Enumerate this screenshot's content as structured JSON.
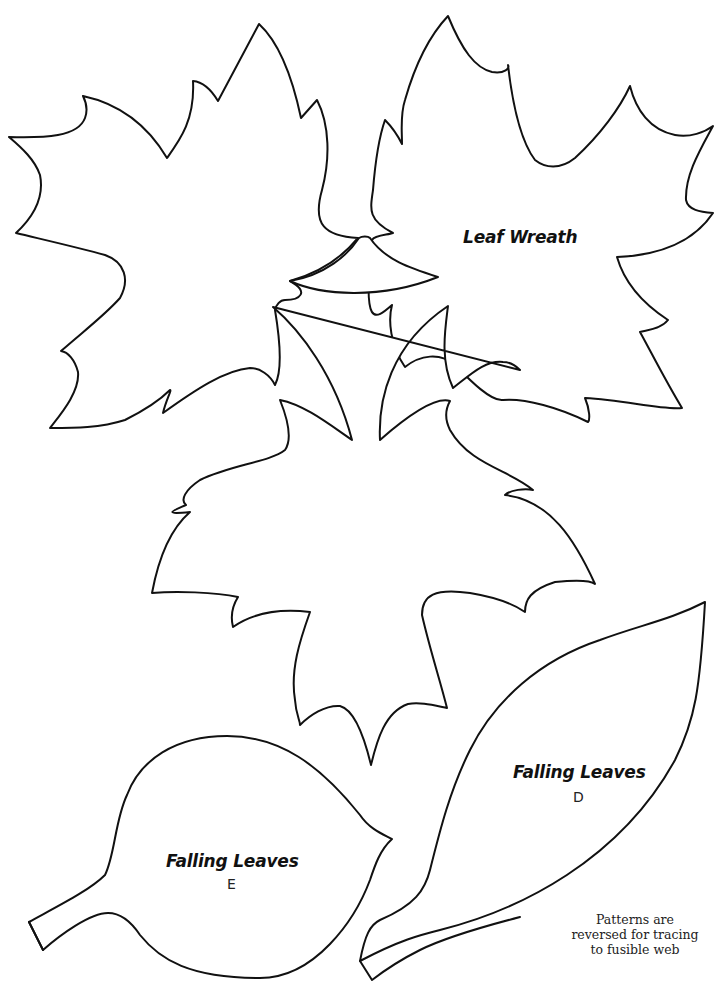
{
  "page": {
    "background": "#ffffff",
    "line_color": "#111111"
  },
  "patterns": [
    {
      "id": "maple-top-left",
      "label": ""
    },
    {
      "id": "maple-top-right",
      "label": "Leaf Wreath"
    },
    {
      "id": "maple-center",
      "label": ""
    },
    {
      "id": "oval-leaf-e",
      "label": "Falling Leaves",
      "letter": "E"
    },
    {
      "id": "long-leaf-d",
      "label": "Falling Leaves",
      "letter": "D"
    }
  ],
  "labels": {
    "leaf_wreath": "Leaf Wreath",
    "falling_leaves_d": "Falling Leaves",
    "letter_d": "D",
    "falling_leaves_e": "Falling Leaves",
    "letter_e": "E"
  },
  "note": {
    "line1": "Patterns are",
    "line2": "reversed for tracing",
    "line3": "to fusible web"
  }
}
